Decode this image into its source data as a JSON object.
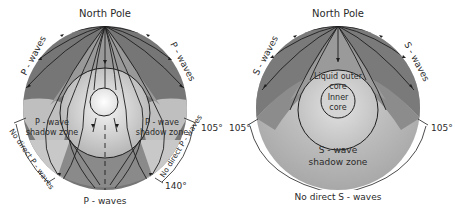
{
  "left_diagram": {
    "title": "North Pole",
    "wave_label_left": "P - waves",
    "wave_label_right": "P - waves",
    "wave_label_bottom": "P - waves",
    "shadow_left_line1": "P - wave",
    "shadow_left_line2": "shadow zone",
    "shadow_right_line1": "P - wave",
    "shadow_right_line2": "shadow zone",
    "no_direct_left": "No direct P - waves",
    "no_direct_right": "No direct P - waves",
    "angle_105": "105°",
    "angle_140": "140°"
  },
  "right_diagram": {
    "title": "North Pole",
    "wave_label_left": "S - waves",
    "wave_label_right": "S - waves",
    "outer_core_line1": "Liquid outer",
    "outer_core_line2": "core",
    "inner_core_line1": "Inner",
    "inner_core_line2": "core",
    "shadow_line1": "S - wave",
    "shadow_line2": "shadow zone",
    "angle_left": "105°",
    "angle_right": "105°",
    "no_direct": "No direct S - waves"
  },
  "colors": {
    "mantle_dark": "#6f6f6f",
    "mantle_mid": "#8e8e8e",
    "shadow_light": "#c4c4c4",
    "core_outer": "#b9b9b9",
    "core_inner": "#efefef",
    "line": "#1e1e1e"
  }
}
